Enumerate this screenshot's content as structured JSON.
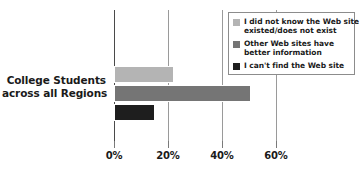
{
  "chart_data": {
    "type": "bar",
    "orientation": "horizontal",
    "title": "",
    "xlabel": "",
    "ylabel": "",
    "categories": [
      "College Students across all Regions"
    ],
    "category_label_lines": [
      "College Students",
      "across all Regions"
    ],
    "series": [
      {
        "name": "I did not know the Web site existed/does not exist",
        "name_lines": [
          "I did not know the Web site",
          "existed/does not exist"
        ],
        "values": [
          19
        ],
        "color": "#b4b4b4"
      },
      {
        "name": "Other Web sites have better information",
        "name_lines": [
          "Other Web sites have",
          "better information"
        ],
        "values": [
          43
        ],
        "color": "#757575"
      },
      {
        "name": "I can't find the Web site",
        "name_lines": [
          "I can't find the Web site"
        ],
        "values": [
          13
        ],
        "color": "#1e1e1e"
      }
    ],
    "xlim": [
      0,
      68
    ],
    "xticks": [
      0,
      20,
      40,
      60
    ],
    "xtick_labels": [
      "0%",
      "20%",
      "40%",
      "60%"
    ],
    "grid": "vertical",
    "legend_position": "top-right"
  },
  "axis": {
    "ticks": [
      {
        "label": "0%",
        "value": 0
      },
      {
        "label": "20%",
        "value": 20
      },
      {
        "label": "40%",
        "value": 40
      },
      {
        "label": "60%",
        "value": 60
      }
    ]
  },
  "legend": {
    "items": [
      {
        "color": "#b4b4b4",
        "line1": "I did not know the Web site",
        "line2": "existed/does not exist"
      },
      {
        "color": "#757575",
        "line1": "Other Web sites have",
        "line2": "better information"
      },
      {
        "color": "#1e1e1e",
        "line1": "I can't find the Web site",
        "line2": ""
      }
    ]
  },
  "category": {
    "line1": "College Students",
    "line2": "across all Regions"
  },
  "colors": {
    "bar_light": "#b4b4b4",
    "bar_medium": "#757575",
    "bar_dark": "#1e1e1e",
    "gridline": "#9a9a9a",
    "axis": "#4a4a4a",
    "text": "#1a1a1a",
    "background": "#ffffff"
  }
}
